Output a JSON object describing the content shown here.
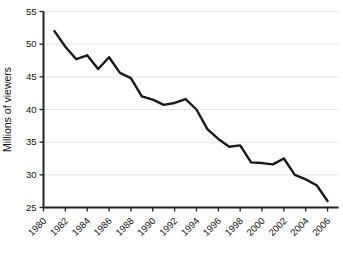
{
  "chart_data": {
    "type": "line",
    "title": "",
    "xlabel": "",
    "ylabel": "Millions of viewers",
    "xlim": [
      1980,
      2007
    ],
    "ylim": [
      25,
      55
    ],
    "yticks": [
      25,
      30,
      35,
      40,
      45,
      50,
      55
    ],
    "xticks": [
      1980,
      1982,
      1984,
      1986,
      1988,
      1990,
      1992,
      1994,
      1996,
      1998,
      2000,
      2002,
      2004,
      2006
    ],
    "grid": "horizontal",
    "legend": "none",
    "series": [
      {
        "name": "Millions of viewers",
        "color": "#1a1a1a",
        "x": [
          1981,
          1982,
          1983,
          1984,
          1985,
          1986,
          1987,
          1988,
          1989,
          1990,
          1991,
          1992,
          1993,
          1994,
          1995,
          1996,
          1997,
          1998,
          1999,
          2000,
          2001,
          2002,
          2003,
          2004,
          2005,
          2006
        ],
        "values": [
          52.0,
          49.6,
          47.7,
          48.3,
          46.2,
          48.0,
          45.6,
          44.8,
          42.0,
          41.5,
          40.7,
          41.0,
          41.6,
          40.0,
          37.0,
          35.5,
          34.3,
          34.5,
          31.9,
          31.8,
          31.6,
          32.5,
          30.0,
          29.3,
          28.4,
          26.0
        ]
      }
    ]
  },
  "colors": {
    "line": "#1a1a1a",
    "grid": "#dedede",
    "axis": "#222222",
    "background": "#ffffff",
    "text": "#111111"
  }
}
